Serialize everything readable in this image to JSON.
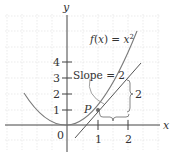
{
  "figure": {
    "axes": {
      "x_label": "x",
      "y_label": "y",
      "origin_label": "0",
      "x_ticks": [
        "1",
        "2"
      ],
      "y_ticks": [
        "1",
        "2",
        "3",
        "4"
      ]
    },
    "curve_label": "f(x) = x²",
    "curve_label_parts": {
      "f": "f",
      "open": "(",
      "x": "x",
      "close": ")",
      "eq": " = ",
      "base": "x",
      "exp": "2"
    },
    "tangent_label": "Slope = 2",
    "point_label": "P",
    "run_label": "1",
    "rise_label": "2",
    "colors": {
      "axis": "#444444",
      "grid": "#dddddd",
      "curve": "#7a7a7a",
      "tangent": "#555555",
      "point": "#666666",
      "text": "#333333"
    }
  }
}
